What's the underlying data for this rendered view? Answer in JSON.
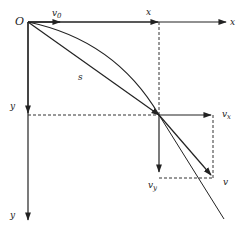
{
  "diagram": {
    "labels": {
      "origin": "O",
      "v0_main": "v",
      "v0_sub": "0",
      "x_mid": "x",
      "x_axis": "x",
      "y_mid": "y",
      "y_axis": "y",
      "s": "s",
      "vx_main": "v",
      "vx_sub": "x",
      "vy_main": "v",
      "vy_sub": "y",
      "v": "v"
    },
    "colors": {
      "line": "#222222",
      "dashed": "#333333",
      "background": "#ffffff"
    }
  }
}
